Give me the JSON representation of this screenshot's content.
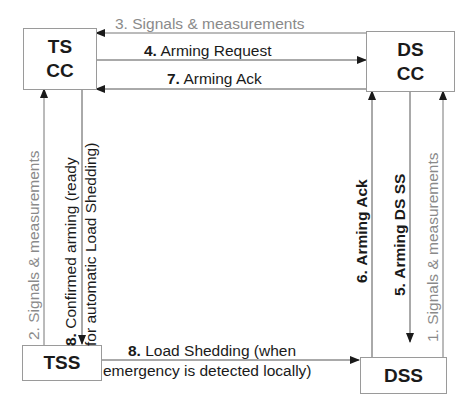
{
  "nodes": {
    "ts_cc": {
      "line1": "TS",
      "line2": "CC"
    },
    "ds_cc": {
      "line1": "DS",
      "line2": "CC"
    },
    "tss": {
      "label": "TSS"
    },
    "dss": {
      "label": "DSS"
    }
  },
  "edges": [
    {
      "id": "e1",
      "num": "1.",
      "text": "Signals & measurements",
      "from": "DSS",
      "to": "DS CC",
      "style": "gray"
    },
    {
      "id": "e2",
      "num": "2.",
      "text": "Signals & measurements",
      "from": "TSS",
      "to": "TS CC",
      "style": "gray"
    },
    {
      "id": "e3",
      "num": "3.",
      "text": "Signals & measurements",
      "from": "DS CC",
      "to": "TS CC",
      "style": "gray"
    },
    {
      "id": "e4",
      "num": "4.",
      "text": "Arming Request",
      "from": "TS CC",
      "to": "DS CC",
      "style": "black"
    },
    {
      "id": "e5",
      "num": "5.",
      "text": "Arming DS SS",
      "from": "DS CC",
      "to": "DSS",
      "style": "black-bold"
    },
    {
      "id": "e6",
      "num": "6.",
      "text": "Arming Ack",
      "from": "DSS",
      "to": "DS CC",
      "style": "black-bold"
    },
    {
      "id": "e7",
      "num": "7.",
      "text": "Arming Ack",
      "from": "DS CC",
      "to": "TS CC",
      "style": "black"
    },
    {
      "id": "e8a",
      "num": "8.",
      "text_line1": "Confirmed arming (ready",
      "text_line2": "for automatic Load Shedding)",
      "from": "TS CC",
      "to": "TSS",
      "style": "black"
    },
    {
      "id": "e8b",
      "num": "8.",
      "text_line1": "Load Shedding (when",
      "text_line2": "emergency is detected locally)",
      "from": "TSS",
      "to": "DSS",
      "style": "black"
    }
  ],
  "colors": {
    "line": "#555555",
    "gray_text": "#8a8a8a",
    "text": "#1a1a1a",
    "border": "#9a9a9a"
  }
}
